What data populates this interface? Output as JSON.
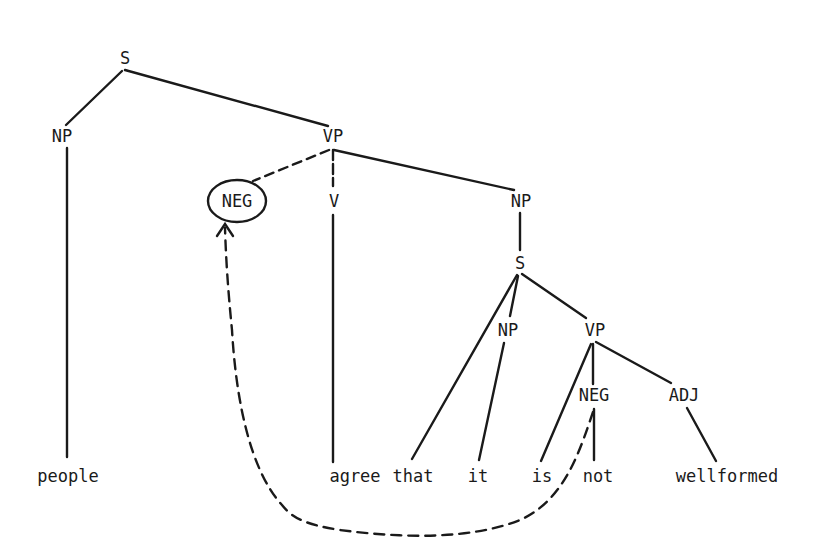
{
  "diagram": {
    "type": "syntax-tree",
    "colors": {
      "ink": "#1a1a1a",
      "background": "#ffffff"
    },
    "nodes": {
      "s_root": {
        "label": "S",
        "x": 125,
        "y": 60
      },
      "np_subj": {
        "label": "NP",
        "x": 62,
        "y": 136
      },
      "vp_main": {
        "label": "VP",
        "x": 333,
        "y": 136
      },
      "neg_raised": {
        "label": "NEG",
        "x": 237,
        "y": 201,
        "circled": true
      },
      "v_main": {
        "label": "V",
        "x": 334,
        "y": 201
      },
      "np_obj": {
        "label": "NP",
        "x": 521,
        "y": 201
      },
      "s_embedded": {
        "label": "S",
        "x": 520,
        "y": 264
      },
      "np_embedded": {
        "label": "NP",
        "x": 508,
        "y": 330
      },
      "vp_embedded": {
        "label": "VP",
        "x": 595,
        "y": 330
      },
      "neg_embedded": {
        "label": "NEG",
        "x": 594,
        "y": 395
      },
      "adj": {
        "label": "ADJ",
        "x": 684,
        "y": 395
      }
    },
    "words": {
      "people": {
        "label": "people",
        "x": 68,
        "y": 477
      },
      "agree": {
        "label": "agree",
        "x": 355,
        "y": 477
      },
      "that": {
        "label": "that",
        "x": 413,
        "y": 477
      },
      "it": {
        "label": "it",
        "x": 478,
        "y": 477
      },
      "is": {
        "label": "is",
        "x": 542,
        "y": 477
      },
      "not": {
        "label": "not",
        "x": 598,
        "y": 477
      },
      "wellformed": {
        "label": "wellformed",
        "x": 727,
        "y": 477
      }
    },
    "edges": [
      {
        "from": "s_root",
        "to": "np_subj",
        "style": "solid"
      },
      {
        "from": "s_root",
        "to": "vp_main",
        "style": "solid"
      },
      {
        "from": "np_subj",
        "to": "people",
        "style": "solid"
      },
      {
        "from": "vp_main",
        "to": "neg_raised",
        "style": "dashed"
      },
      {
        "from": "vp_main",
        "to": "v_main",
        "style": "solid"
      },
      {
        "from": "vp_main",
        "to": "np_obj",
        "style": "solid"
      },
      {
        "from": "v_main",
        "to": "agree",
        "style": "solid"
      },
      {
        "from": "np_obj",
        "to": "s_embedded",
        "style": "solid"
      },
      {
        "from": "s_embedded",
        "to": "that",
        "style": "solid"
      },
      {
        "from": "s_embedded",
        "to": "np_embedded",
        "style": "solid"
      },
      {
        "from": "s_embedded",
        "to": "vp_embedded",
        "style": "solid"
      },
      {
        "from": "np_embedded",
        "to": "it",
        "style": "solid"
      },
      {
        "from": "vp_embedded",
        "to": "is",
        "style": "solid"
      },
      {
        "from": "vp_embedded",
        "to": "neg_embedded",
        "style": "solid"
      },
      {
        "from": "vp_embedded",
        "to": "adj",
        "style": "solid"
      },
      {
        "from": "neg_embedded",
        "to": "not",
        "style": "solid"
      },
      {
        "from": "adj",
        "to": "wellformed",
        "style": "solid"
      }
    ],
    "movement_arrow": {
      "from": "neg_embedded",
      "to": "neg_raised",
      "style": "dashed",
      "description": "NEG raising"
    }
  }
}
